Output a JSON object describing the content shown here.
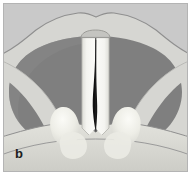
{
  "figure": {
    "panel_label": "b",
    "caption_text": "",
    "type": "anatomical-illustration",
    "view": "superior / endoscopic",
    "plate_background_color": "#c9c9c9",
    "plate_border_color": "#b4b4b4",
    "page_background_color": "#ffffff"
  },
  "palette": {
    "background_gray": "#c9c9c9",
    "mucosa_light": "#d6d6d2",
    "pharynx_dark": "#7f7f7f",
    "pharynx_dark_edge": "#6f6f6f",
    "vocal_cord_white": "#f2f2ee",
    "vocal_cord_shadow": "#cfcfca",
    "glottis_black": "#101010",
    "arytenoid_highlight": "#eeeee8",
    "outline_gray": "#8a8a8a",
    "label_black": "#1d1d1d"
  },
  "structures": [
    {
      "id": "epiglottis",
      "name": "epiglottis",
      "fill": "#d6d6d2",
      "note": "broad wavy pale band across the superior aspect of the field"
    },
    {
      "id": "pharyngeal-wall",
      "name": "pharyngeal wall / piriform recess",
      "fill": "#7f7f7f",
      "note": "large dark horseshoe-shaped region surrounding the glottis"
    },
    {
      "id": "aryepiglottic-fold-left",
      "name": "left aryepiglottic fold",
      "fill": "#d6d6d2",
      "note": "pale oblique band running inferomedially on the left"
    },
    {
      "id": "aryepiglottic-fold-right",
      "name": "right aryepiglottic fold",
      "fill": "#d6d6d2",
      "note": "pale oblique band running inferomedially on the right"
    },
    {
      "id": "vocal-cord-left",
      "name": "left vocal cord (true vocal fold)",
      "fill": "#f2f2ee",
      "note": "vertical white band left of midline"
    },
    {
      "id": "vocal-cord-right",
      "name": "right vocal cord (true vocal fold)",
      "fill": "#f2f2ee",
      "note": "vertical white band right of midline"
    },
    {
      "id": "glottis",
      "name": "glottic chink / rima glottidis",
      "fill": "#101010",
      "note": "narrow dark midline slit widening slightly at its mid portion"
    },
    {
      "id": "anterior-commissure",
      "name": "anterior commissure",
      "fill": "#c4c4c0",
      "note": "small cap at the superior end of the vocal cords"
    },
    {
      "id": "arytenoid-left",
      "name": "left arytenoid / vocal process eminence",
      "fill": "#eeeee8",
      "note": "rounded pale bump inferolateral to the cord"
    },
    {
      "id": "arytenoid-right",
      "name": "right arytenoid / vocal process eminence",
      "fill": "#eeeee8",
      "note": "rounded pale bump inferolateral to the cord"
    },
    {
      "id": "posterior-commissure",
      "name": "posterior commissure / interarytenoid area",
      "fill": "#d9d9d4",
      "note": "broad pale shelf across the inferior field"
    }
  ]
}
